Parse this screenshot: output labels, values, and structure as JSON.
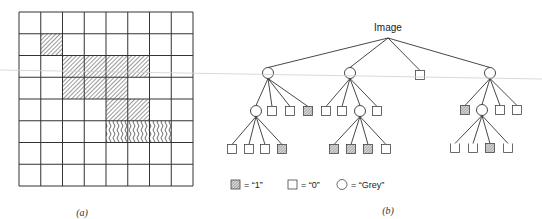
{
  "panel_a": {
    "caption": "(a)",
    "grid": {
      "rows": 8,
      "cols": 8,
      "x": 19,
      "y": 12,
      "size": 174,
      "filled_cells": [
        [
          1,
          1
        ],
        [
          2,
          2
        ],
        [
          2,
          3
        ],
        [
          2,
          4
        ],
        [
          2,
          5
        ],
        [
          3,
          2
        ],
        [
          3,
          3
        ],
        [
          3,
          4
        ],
        [
          4,
          4
        ],
        [
          4,
          5
        ],
        [
          5,
          4
        ],
        [
          5,
          5
        ],
        [
          5,
          6
        ]
      ],
      "wavy_row": 5
    }
  },
  "panel_b": {
    "caption": "(b)",
    "root_label": "Image",
    "root": {
      "x": 388,
      "y": 38
    },
    "nodes": [
      {
        "id": "n1",
        "type": "grey",
        "x": 268,
        "y": 73,
        "parent": "root"
      },
      {
        "id": "n2",
        "type": "grey",
        "x": 350,
        "y": 73,
        "parent": "root"
      },
      {
        "id": "n3",
        "type": "zero",
        "x": 420,
        "y": 75,
        "parent": "root"
      },
      {
        "id": "n4",
        "type": "grey",
        "x": 490,
        "y": 73,
        "parent": "root"
      },
      {
        "id": "n1a",
        "type": "grey",
        "x": 256,
        "y": 111,
        "parent": "n1"
      },
      {
        "id": "n1b",
        "type": "zero",
        "x": 272,
        "y": 111,
        "parent": "n1"
      },
      {
        "id": "n1c",
        "type": "zero",
        "x": 290,
        "y": 111,
        "parent": "n1"
      },
      {
        "id": "n1d",
        "type": "one",
        "x": 308,
        "y": 111,
        "parent": "n1"
      },
      {
        "id": "n1a1",
        "type": "zero",
        "x": 232,
        "y": 149,
        "parent": "n1a"
      },
      {
        "id": "n1a2",
        "type": "zero",
        "x": 249,
        "y": 149,
        "parent": "n1a"
      },
      {
        "id": "n1a3",
        "type": "zero",
        "x": 265,
        "y": 149,
        "parent": "n1a"
      },
      {
        "id": "n1a4",
        "type": "one",
        "x": 282,
        "y": 149,
        "parent": "n1a"
      },
      {
        "id": "n2a",
        "type": "zero",
        "x": 326,
        "y": 111,
        "parent": "n2"
      },
      {
        "id": "n2b",
        "type": "zero",
        "x": 342,
        "y": 111,
        "parent": "n2"
      },
      {
        "id": "n2c",
        "type": "grey",
        "x": 360,
        "y": 111,
        "parent": "n2"
      },
      {
        "id": "n2d",
        "type": "zero",
        "x": 377,
        "y": 111,
        "parent": "n2"
      },
      {
        "id": "n2c1",
        "type": "one",
        "x": 334,
        "y": 149,
        "parent": "n2c"
      },
      {
        "id": "n2c2",
        "type": "one",
        "x": 351,
        "y": 149,
        "parent": "n2c"
      },
      {
        "id": "n2c3",
        "type": "one",
        "x": 368,
        "y": 149,
        "parent": "n2c"
      },
      {
        "id": "n2c4",
        "type": "zero",
        "x": 386,
        "y": 149,
        "parent": "n2c"
      },
      {
        "id": "n4a",
        "type": "one",
        "x": 465,
        "y": 110,
        "parent": "n4"
      },
      {
        "id": "n4b",
        "type": "grey",
        "x": 482,
        "y": 110,
        "parent": "n4"
      },
      {
        "id": "n4c",
        "type": "zero",
        "x": 500,
        "y": 110,
        "parent": "n4"
      },
      {
        "id": "n4d",
        "type": "zero",
        "x": 517,
        "y": 110,
        "parent": "n4"
      },
      {
        "id": "n4b1",
        "type": "zero_open",
        "x": 455,
        "y": 148,
        "parent": "n4b"
      },
      {
        "id": "n4b2",
        "type": "zero_open",
        "x": 473,
        "y": 148,
        "parent": "n4b"
      },
      {
        "id": "n4b3",
        "type": "one",
        "x": 490,
        "y": 148,
        "parent": "n4b"
      },
      {
        "id": "n4b4",
        "type": "zero_open",
        "x": 508,
        "y": 148,
        "parent": "n4b"
      }
    ],
    "legend": [
      {
        "symbol": "one",
        "text": "= “1”"
      },
      {
        "symbol": "zero",
        "text": "= “0”"
      },
      {
        "symbol": "grey",
        "text": "= “Grey”"
      }
    ]
  },
  "colors": {
    "line": "#333333",
    "hatch": "#555555",
    "artifact": "#c8c8c8"
  }
}
